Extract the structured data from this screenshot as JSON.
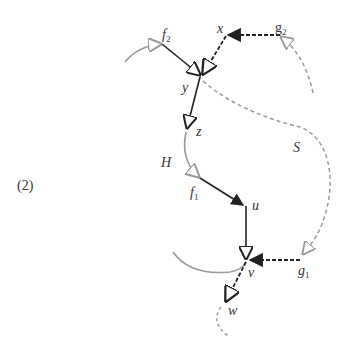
{
  "figure": {
    "number_label": "(2)",
    "nodes": {
      "f2": {
        "base": "f",
        "sub": "2"
      },
      "x": {
        "base": "x"
      },
      "g2": {
        "base": "g",
        "sub": "2"
      },
      "y": {
        "base": "y"
      },
      "z": {
        "base": "z"
      },
      "H": {
        "base": "H"
      },
      "S": {
        "base": "S"
      },
      "f1": {
        "base": "f",
        "sub": "1"
      },
      "u": {
        "base": "u"
      },
      "v": {
        "base": "v"
      },
      "g1": {
        "base": "g",
        "sub": "1"
      },
      "w": {
        "base": "w"
      }
    },
    "edges": [
      {
        "from": "f2",
        "to": "y",
        "style": "solid-black"
      },
      {
        "from": "x",
        "to": "y",
        "style": "dashed-black"
      },
      {
        "from": "g2",
        "to": "x",
        "style": "dashed-black"
      },
      {
        "from": "y",
        "to": "z",
        "style": "solid-black"
      },
      {
        "from": "f1",
        "to": "u",
        "style": "solid-black"
      },
      {
        "from": "u",
        "to": "v",
        "style": "solid-black"
      },
      {
        "from": "g1",
        "to": "v",
        "style": "dashed-black"
      },
      {
        "from": "v",
        "to": "w",
        "style": "dashed-black"
      }
    ],
    "curves": [
      {
        "name": "H",
        "style": "solid-gray"
      },
      {
        "name": "S",
        "style": "dashed-gray"
      }
    ],
    "colors": {
      "black": "#222222",
      "gray": "#999999"
    }
  }
}
